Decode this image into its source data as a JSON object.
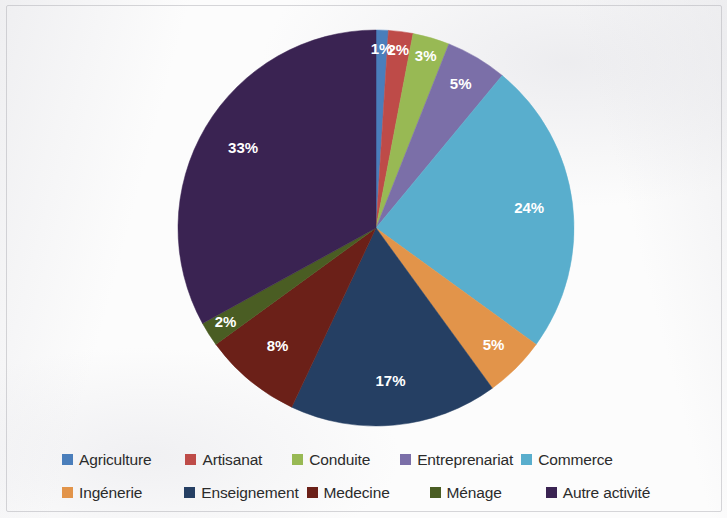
{
  "chart_data": {
    "type": "pie",
    "title": "",
    "subtitle": "",
    "xlabel": "",
    "ylabel": "",
    "grid": false,
    "legend_position": "bottom",
    "value_unit": "%",
    "label_format": "percent",
    "start_angle_deg": 0,
    "direction": "clockwise",
    "categories": [
      "Agriculture",
      "Artisanat",
      "Conduite",
      "Entreprenariat",
      "Commerce",
      "Ingénerie",
      "Enseignement",
      "Medecine",
      "Ménage",
      "Autre activité"
    ],
    "values": [
      1,
      2,
      3,
      5,
      24,
      5,
      17,
      8,
      2,
      33
    ],
    "data_labels": [
      "1%",
      "2%",
      "3%",
      "5%",
      "24%",
      "5%",
      "17%",
      "8%",
      "2%",
      "33%"
    ],
    "colors": [
      "#4A7EBB",
      "#BE4B48",
      "#98B954",
      "#7B6FA8",
      "#59AECD",
      "#E2944A",
      "#253F63",
      "#6B2018",
      "#4A5D23",
      "#3A2352"
    ],
    "total": 100
  },
  "legend": {
    "rows": [
      [
        {
          "label": "Agriculture",
          "color": "#4A7EBB"
        },
        {
          "label": "Artisanat",
          "color": "#BE4B48"
        },
        {
          "label": "Conduite",
          "color": "#98B954"
        },
        {
          "label": "Entreprenariat",
          "color": "#7B6FA8"
        },
        {
          "label": "Commerce",
          "color": "#59AECD"
        }
      ],
      [
        {
          "label": "Ingénerie",
          "color": "#E2944A"
        },
        {
          "label": "Enseignement",
          "color": "#253F63"
        },
        {
          "label": "Medecine",
          "color": "#6B2018"
        },
        {
          "label": "Ménage",
          "color": "#4A5D23"
        },
        {
          "label": "Autre activité",
          "color": "#3A2352"
        }
      ]
    ]
  },
  "geometry": {
    "center_x": 376,
    "center_y": 228,
    "radius": 198,
    "label_radius_ratio": 0.78
  }
}
